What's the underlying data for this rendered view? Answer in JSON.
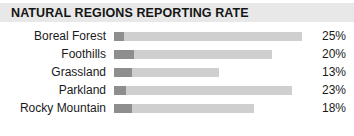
{
  "header": {
    "title": "NATURAL REGIONS REPORTING RATE"
  },
  "colors": {
    "header_band": "#e8e8e8",
    "bar_dark": "#8e8e8e",
    "bar_light": "#cfcfcf",
    "text": "#1a1a1a"
  },
  "chart_data": {
    "type": "bar",
    "title": "NATURAL REGIONS REPORTING RATE",
    "xlabel": "",
    "ylabel": "",
    "orientation": "horizontal",
    "grid": false,
    "legend": "none",
    "xlim": [
      0,
      100
    ],
    "categories": [
      "Boreal Forest",
      "Foothills",
      "Grassland",
      "Parkland",
      "Rocky Mountain"
    ],
    "values": [
      25,
      20,
      13,
      23,
      18
    ],
    "value_labels": [
      "25%",
      "20%",
      "13%",
      "23%",
      "18%"
    ],
    "bar_total_px": [
      188,
      158,
      105,
      178,
      140
    ],
    "bar_dark_px": [
      10,
      20,
      18,
      12,
      18
    ]
  },
  "rows": [
    {
      "label": "Boreal Forest",
      "value": "25%",
      "dark_px": 10,
      "total_px": 188
    },
    {
      "label": "Foothills",
      "value": "20%",
      "dark_px": 20,
      "total_px": 158
    },
    {
      "label": "Grassland",
      "value": "13%",
      "dark_px": 18,
      "total_px": 105
    },
    {
      "label": "Parkland",
      "value": "23%",
      "dark_px": 12,
      "total_px": 178
    },
    {
      "label": "Rocky Mountain",
      "value": "18%",
      "dark_px": 18,
      "total_px": 140
    }
  ]
}
